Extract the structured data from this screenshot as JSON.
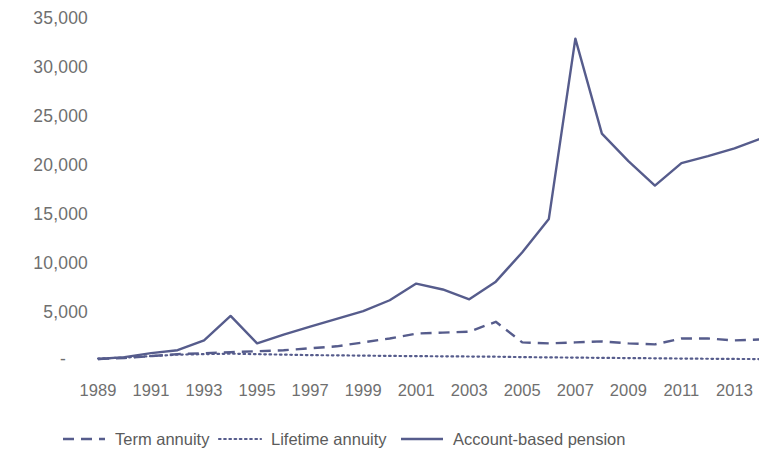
{
  "chart_data": {
    "type": "line",
    "title": "",
    "xlabel": "",
    "ylabel": "",
    "grid": false,
    "legend_position": "bottom",
    "xlim": [
      1989,
      2014
    ],
    "ylim": [
      0,
      35000
    ],
    "x": [
      1989,
      1990,
      1991,
      1992,
      1993,
      1994,
      1995,
      1996,
      1997,
      1998,
      1999,
      2000,
      2001,
      2002,
      2003,
      2004,
      2005,
      2006,
      2007,
      2008,
      2009,
      2010,
      2011,
      2012,
      2013,
      2014
    ],
    "xticks": [
      "1989",
      "1991",
      "1993",
      "1995",
      "1997",
      "1999",
      "2001",
      "2003",
      "2005",
      "2007",
      "2009",
      "2011",
      "2013"
    ],
    "yticks": [
      "-",
      "5,000",
      "10,000",
      "15,000",
      "20,000",
      "25,000",
      "30,000",
      "35,000"
    ],
    "ytick_values": [
      0,
      5000,
      10000,
      15000,
      20000,
      25000,
      30000,
      35000
    ],
    "series": [
      {
        "name": "Term annuity",
        "style": "dashed",
        "color": "#565c8c",
        "values": [
          300,
          400,
          600,
          800,
          900,
          1000,
          1100,
          1200,
          1400,
          1600,
          2000,
          2400,
          2900,
          3000,
          3100,
          4100,
          2000,
          1900,
          2000,
          2100,
          1900,
          1800,
          2400,
          2400,
          2200,
          2300
        ]
      },
      {
        "name": "Lifetime annuity",
        "style": "dotted",
        "color": "#565c8c",
        "values": [
          350,
          450,
          600,
          750,
          800,
          850,
          800,
          750,
          700,
          680,
          650,
          620,
          600,
          580,
          560,
          540,
          500,
          470,
          450,
          420,
          400,
          380,
          350,
          330,
          310,
          300
        ]
      },
      {
        "name": "Account-based pension",
        "style": "solid",
        "color": "#565c8c",
        "values": [
          300,
          500,
          900,
          1200,
          2200,
          4700,
          1900,
          2800,
          3600,
          4400,
          5200,
          6300,
          8000,
          7400,
          6400,
          8200,
          11200,
          14600,
          33000,
          23300,
          20500,
          18000,
          20300,
          21000,
          21800,
          22800
        ]
      }
    ]
  },
  "legend": {
    "items": [
      {
        "label": "Term annuity",
        "style": "dashed"
      },
      {
        "label": "Lifetime annuity",
        "style": "dotted"
      },
      {
        "label": "Account-based pension",
        "style": "solid"
      }
    ]
  },
  "colors": {
    "line": "#565c8c",
    "text": "#6f6f6f",
    "legend_text": "#5b5b5b",
    "background": "#ffffff"
  }
}
